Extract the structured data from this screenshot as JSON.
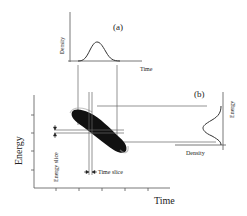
{
  "panel_a": {
    "label": "(a)",
    "xlabel": "Time",
    "ylabel": "Density"
  },
  "panel_b": {
    "label": "(b)",
    "xlabel": "Density",
    "ylabel": "Energy"
  },
  "main_plot": {
    "xlabel": "Time",
    "ylabel": "Energy",
    "energy_slice_label": "Energy slice",
    "time_slice_label": "Time slice"
  },
  "colors": {
    "line": "#555555",
    "scatter": "#111111"
  }
}
